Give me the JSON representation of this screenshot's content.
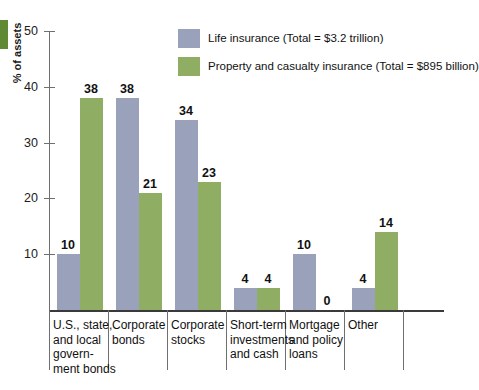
{
  "chart_data": {
    "type": "bar",
    "title": "",
    "xlabel": "",
    "ylabel": "% of assets",
    "ylim": [
      0,
      50
    ],
    "ytick_labels": [
      "50",
      "40",
      "30",
      "20",
      "10"
    ],
    "yticks": [
      50,
      40,
      30,
      20,
      10
    ],
    "grid": false,
    "legend_position": "top-right",
    "categories": [
      "U.S., state, and local govern- ment bonds",
      "Corporate bonds",
      "Corporate stocks",
      "Short-term investments and cash",
      "Mortgage and policy loans",
      "Other"
    ],
    "category_lines": [
      [
        "U.S., state,",
        "and local",
        "govern-",
        "ment bonds"
      ],
      [
        "Corporate",
        "bonds"
      ],
      [
        "Corporate",
        "stocks"
      ],
      [
        "Short-term",
        "investments",
        "and cash"
      ],
      [
        "Mortgage",
        "and policy",
        "loans"
      ],
      [
        "Other"
      ]
    ],
    "series": [
      {
        "name": "Life insurance (Total = $3.2 trillion)",
        "color": "#99a2ba",
        "values": [
          10,
          38,
          34,
          4,
          10,
          4
        ]
      },
      {
        "name": "Property and casualty insurance (Total = $895 billion)",
        "color": "#8fae63",
        "values": [
          38,
          21,
          23,
          4,
          0,
          14
        ]
      }
    ]
  },
  "legend": [
    {
      "label": "Life insurance (Total = $3.2 trillion)",
      "color": "#99a2ba"
    },
    {
      "label": "Property and casualty insurance (Total = $895 billion)",
      "color": "#8fae63"
    }
  ],
  "axis": {
    "y_title": "% of assets",
    "y_tick_labels": [
      "50",
      "40",
      "30",
      "20",
      "10"
    ]
  },
  "values": {
    "blue": [
      "10",
      "38",
      "34",
      "4",
      "10",
      "4"
    ],
    "green": [
      "38",
      "21",
      "23",
      "4",
      "0",
      "14"
    ]
  },
  "colors": {
    "blue": "#99a2ba",
    "green": "#8fae63",
    "edge_marker": "#5f8a33",
    "axis": "#6f6f6f",
    "text": "#111111"
  }
}
